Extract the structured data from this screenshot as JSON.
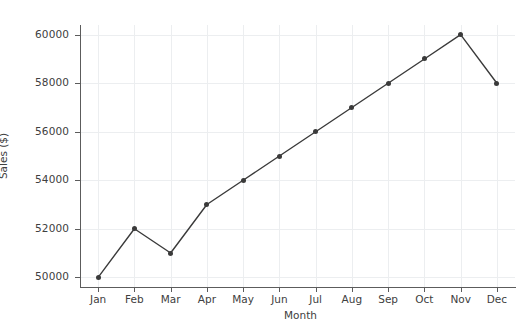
{
  "chart_data": {
    "type": "line",
    "title": "",
    "xlabel": "Month",
    "ylabel": "Sales ($)",
    "categories": [
      "Jan",
      "Feb",
      "Mar",
      "Apr",
      "May",
      "Jun",
      "Jul",
      "Aug",
      "Sep",
      "Oct",
      "Nov",
      "Dec"
    ],
    "values": [
      50000,
      52000,
      51000,
      53000,
      54000,
      55000,
      56000,
      57000,
      58000,
      59000,
      60000,
      58000
    ],
    "series": [
      {
        "name": "Sales",
        "values": [
          50000,
          52000,
          51000,
          53000,
          54000,
          55000,
          56000,
          57000,
          58000,
          59000,
          60000,
          58000
        ]
      }
    ],
    "ylim": [
      49600,
      60400
    ],
    "yticks": [
      50000,
      52000,
      54000,
      56000,
      58000,
      60000
    ],
    "ytick_labels": [
      "50000",
      "52000",
      "54000",
      "56000",
      "58000",
      "60000"
    ],
    "xtick_labels": [
      "Jan",
      "Feb",
      "Mar",
      "Apr",
      "May",
      "Jun",
      "Jul",
      "Aug",
      "Sep",
      "Oct",
      "Nov",
      "Dec"
    ],
    "grid": true,
    "grid_axis": "both",
    "legend": null,
    "marker": "circle",
    "line_color": "#3a3a3a",
    "marker_color": "#3a3a3a",
    "grid_color": "#eceef0",
    "axis_color": "#5c5c5c",
    "text_color": "#404040",
    "background_color": "#ffffff"
  }
}
